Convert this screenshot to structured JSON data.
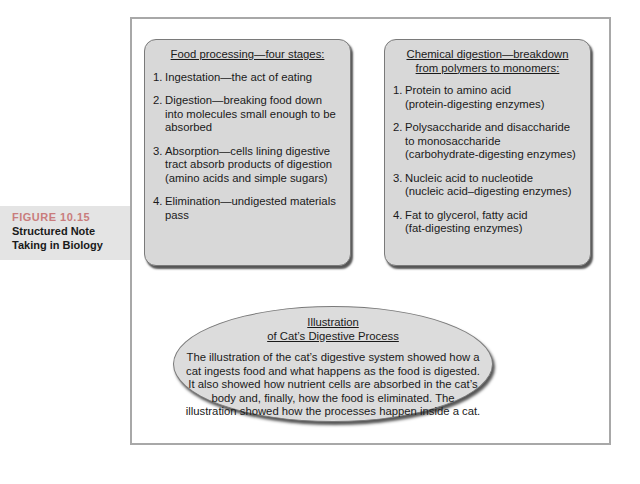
{
  "caption": {
    "figure_label": "FIGURE 10.15",
    "figure_label_color": "#c97c7c",
    "title_line1": "Structured Note",
    "title_line2": "Taking in Biology"
  },
  "left_box": {
    "heading": "Food processing—four stages:",
    "items": [
      {
        "num": "1.",
        "text": "Ingestation—the act of eating"
      },
      {
        "num": "2.",
        "text": "Digestion—breaking food down into molecules small enough to be absorbed"
      },
      {
        "num": "3.",
        "text": "Absorption—cells lining digestive tract absorb products of digestion (amino acids and simple sugars)"
      },
      {
        "num": "4.",
        "text": "Elimination—undigested materials pass"
      }
    ]
  },
  "right_box": {
    "heading_line1": "Chemical digestion—breakdown",
    "heading_line2": "from polymers to monomers:",
    "items": [
      {
        "num": "1.",
        "line1": "Protein to amino acid",
        "line2": "(protein-digesting enzymes)"
      },
      {
        "num": "2.",
        "line1": "Polysaccharide and disaccharide to monosaccharide",
        "line2": "(carbohydrate-digesting enzymes)"
      },
      {
        "num": "3.",
        "line1": "Nucleic acid to nucleotide",
        "line2": "(nucleic acid–digesting enzymes)"
      },
      {
        "num": "4.",
        "line1": "Fat to glycerol, fatty acid",
        "line2": "(fat-digesting enzymes)"
      }
    ]
  },
  "ellipse": {
    "heading_line1": "Illustration",
    "heading_line2": "of Cat’s Digestive Process",
    "body": "The illustration of the cat’s digestive system showed how a cat ingests food and what happens as the food is digested. It also showed how nutrient cells are absorbed in the cat’s body and, finally, how the food is eliminated. The illustration showed how the processes happen inside a cat."
  }
}
